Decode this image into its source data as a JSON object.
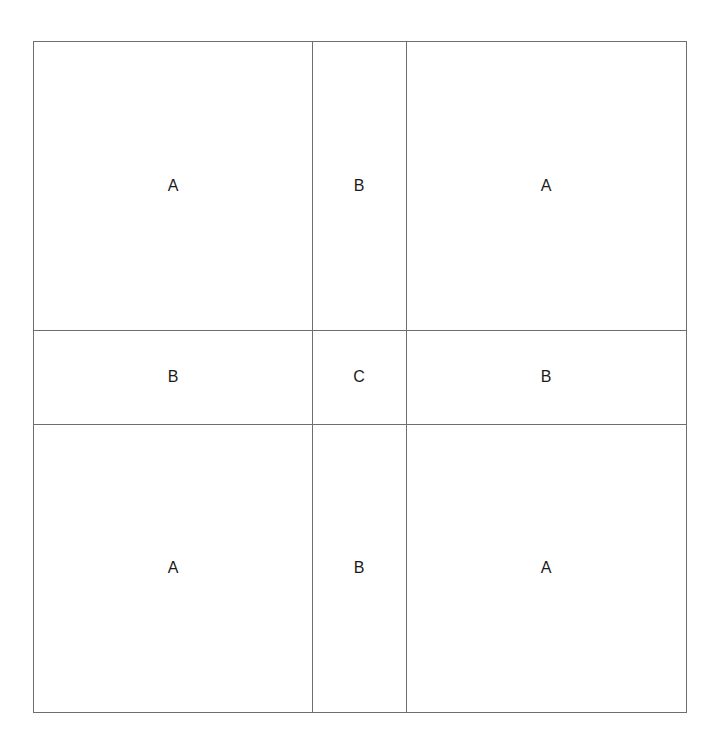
{
  "diagram": {
    "title": "",
    "grid": {
      "columns": 3,
      "rows": 3,
      "cells": [
        {
          "row": 0,
          "col": 0,
          "label": "A"
        },
        {
          "row": 0,
          "col": 1,
          "label": "B"
        },
        {
          "row": 0,
          "col": 2,
          "label": "A"
        },
        {
          "row": 1,
          "col": 0,
          "label": "B"
        },
        {
          "row": 1,
          "col": 1,
          "label": "C"
        },
        {
          "row": 1,
          "col": 2,
          "label": "B"
        },
        {
          "row": 2,
          "col": 0,
          "label": "A"
        },
        {
          "row": 2,
          "col": 1,
          "label": "B"
        },
        {
          "row": 2,
          "col": 2,
          "label": "A"
        }
      ]
    },
    "colors": {
      "line": "#6e6e6e",
      "text": "#1a1a1a",
      "background": "#ffffff"
    }
  }
}
